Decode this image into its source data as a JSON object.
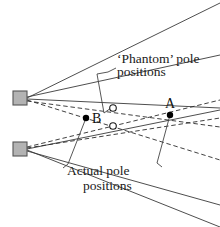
{
  "figure": {
    "background_color": "#ffffff"
  },
  "colors": {
    "sensor_fill": "#b3b3b3",
    "sensor_stroke": "#555555",
    "solid_line": "#3a3a3a",
    "dashed_line": "#2b2b2b",
    "leader_line": "#444444",
    "actual_point_fill": "#000000",
    "phantom_point_fill": "#ffffff",
    "phantom_point_stroke": "#1a1a1a",
    "text": "#111111"
  },
  "annotations": {
    "phantom": {
      "line1": "‘Phantom’ pole",
      "line2": "positions"
    },
    "actual": {
      "line1": "Actual pole",
      "line2": "positions"
    }
  },
  "points": {
    "actual": [
      {
        "id": "B",
        "label": "B",
        "x": 86,
        "y": 118,
        "label_x": 92,
        "label_y": 123
      },
      {
        "id": "A",
        "label": "A",
        "x": 170,
        "y": 115,
        "label_x": 165,
        "label_y": 108
      }
    ],
    "phantom": [
      {
        "id": "P1",
        "x": 113,
        "y": 108
      },
      {
        "id": "P2",
        "x": 113,
        "y": 126
      }
    ]
  },
  "sensors": [
    {
      "id": "sensor-top",
      "x": 13,
      "y": 91,
      "width": 14,
      "height": 14
    },
    {
      "id": "sensor-bottom",
      "x": 13,
      "y": 142,
      "width": 14,
      "height": 14
    }
  ],
  "beams": {
    "solid_from_top_sensor": [
      {
        "x1": 27,
        "y1": 98,
        "x2": 220,
        "y2": 3
      },
      {
        "x1": 27,
        "y1": 99,
        "x2": 220,
        "y2": 108
      }
    ],
    "solid_from_bottom_sensor": [
      {
        "x1": 27,
        "y1": 149,
        "x2": 220,
        "y2": 110
      },
      {
        "x1": 27,
        "y1": 150,
        "x2": 220,
        "y2": 227
      }
    ],
    "dashed_from_top_sensor": [
      {
        "x1": 27,
        "y1": 100,
        "x2": 220,
        "y2": 160
      },
      {
        "x1": 27,
        "y1": 101,
        "x2": 220,
        "y2": 127
      }
    ],
    "dashed_from_bottom_sensor": [
      {
        "x1": 27,
        "y1": 147,
        "x2": 220,
        "y2": 100
      },
      {
        "x1": 27,
        "y1": 148,
        "x2": 220,
        "y2": 118
      }
    ],
    "solid_mid_top": [
      {
        "x1": 27,
        "y1": 97,
        "x2": 220,
        "y2": 55
      }
    ],
    "solid_mid_bottom": [
      {
        "x1": 27,
        "y1": 151,
        "x2": 220,
        "y2": 205
      }
    ]
  },
  "leaders": {
    "phantom_bracket": "M 108 72 L 97 74 L 104 113 L 111 108",
    "phantom_text_hook": "M 108 72 L 116 68",
    "actual_to_B": "M 86 118 L 68 164",
    "actual_to_A": "M 170 115 L 157 163",
    "actual_hook_left": "M 68 164 L 63 168",
    "actual_hook_right": "M 157 163 L 162 167"
  }
}
